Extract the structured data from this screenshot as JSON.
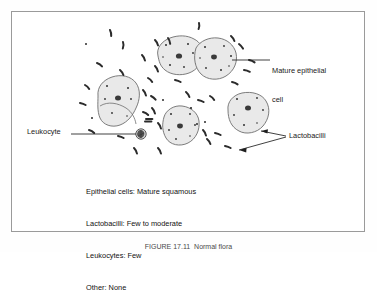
{
  "figure": {
    "panel": {
      "background_color": "#ffffff",
      "border_color": "#9a9a9a"
    },
    "caption": "FIGURE 17.11  Normal flora",
    "labels": {
      "mature_epithelial_line1": "Mature epithelial",
      "mature_epithelial_line2": "cell",
      "leukocyte": "Leukocyte",
      "lactobacilli": "Lactobacilli"
    },
    "legend": {
      "epithelial_cells": "Epithelial cells: Mature squamous",
      "lactobacilli": "Lactobacilli: Few to moderate",
      "leukocytes": "Leukocytes: Few",
      "other": "Other: None"
    },
    "colors": {
      "cell_fill": "#e9e9e9",
      "cell_outline": "#6e6e6e",
      "nucleus": "#3a3a3a",
      "stipple": "#2f2f2f",
      "bacilli": "#2b2b2b",
      "leader_line": "#1f1f1f"
    },
    "counts": {
      "epithelial_cells": 5,
      "leukocytes": 1
    }
  }
}
